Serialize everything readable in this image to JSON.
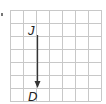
{
  "diagram": {
    "type": "vector-on-grid",
    "grid": {
      "columns": 7,
      "rows": 7,
      "cell_size_px": 13,
      "origin_px": [
        10,
        10
      ],
      "line_color": "#c8c8c8",
      "border_color": "#bdbdbd"
    },
    "vector": {
      "from_label": "J",
      "to_label": "D",
      "from_px": [
        37,
        35
      ],
      "to_px": [
        37,
        88
      ],
      "color": "#333333",
      "direction": "down"
    },
    "labels": {
      "start": "J",
      "end": "D"
    }
  }
}
